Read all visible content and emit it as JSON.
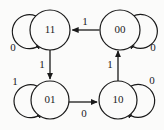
{
  "diagram": {
    "type": "state-transition-diagram",
    "title": "",
    "stroke_color": "#1a1a1a",
    "background_color": "#fbfbfa",
    "states": [
      {
        "id": "s11",
        "label": "11",
        "cx": 50,
        "cy": 30,
        "r": 20
      },
      {
        "id": "s00",
        "label": "00",
        "cx": 120,
        "cy": 30,
        "r": 20
      },
      {
        "id": "s01",
        "label": "01",
        "cx": 50,
        "cy": 100,
        "r": 19
      },
      {
        "id": "s10",
        "label": "10",
        "cx": 118,
        "cy": 100,
        "r": 19
      }
    ],
    "transitions": [
      {
        "id": "t00-11",
        "from": "00",
        "to": "11",
        "label": "1",
        "kind": "edge",
        "label_x": 85,
        "label_y": 22
      },
      {
        "id": "t11-01",
        "from": "11",
        "to": "01",
        "label": "1",
        "kind": "edge",
        "label_x": 42,
        "label_y": 65
      },
      {
        "id": "t01-10",
        "from": "01",
        "to": "10",
        "label": "0",
        "kind": "edge",
        "label_x": 84,
        "label_y": 114
      },
      {
        "id": "t10-00",
        "from": "10",
        "to": "00",
        "label": "1",
        "kind": "edge",
        "label_x": 110,
        "label_y": 65
      },
      {
        "id": "t11-11",
        "from": "11",
        "to": "11",
        "label": "0",
        "kind": "self-loop",
        "side": "left",
        "label_x": 13,
        "label_y": 48
      },
      {
        "id": "t00-00",
        "from": "00",
        "to": "00",
        "label": "0",
        "kind": "self-loop",
        "side": "right",
        "label_x": 153,
        "label_y": 48
      },
      {
        "id": "t01-01",
        "from": "01",
        "to": "01",
        "label": "1",
        "kind": "self-loop",
        "side": "left",
        "label_x": 15,
        "label_y": 82
      },
      {
        "id": "t10-10",
        "from": "10",
        "to": "10",
        "label": "0",
        "kind": "self-loop",
        "side": "right",
        "label_x": 152,
        "label_y": 81
      }
    ]
  }
}
